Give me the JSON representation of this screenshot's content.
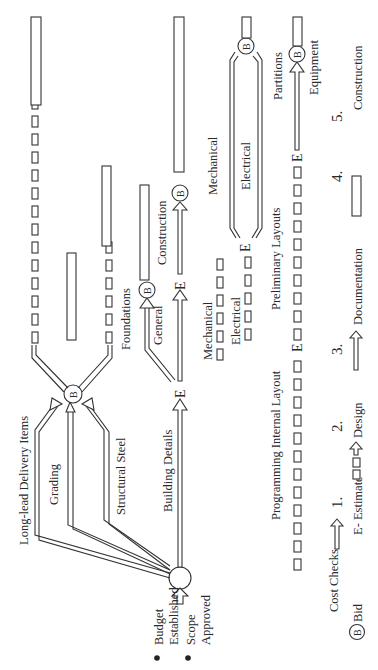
{
  "diagram": {
    "orientation": "rotated-90-ccw",
    "start": {
      "bullets": [
        "Budget Established",
        "Scope Approved"
      ],
      "budget_line1": "Budget",
      "budget_line2": "Established",
      "scope_line1": "Scope",
      "scope_line2": "Approved"
    },
    "paths": {
      "long_lead": "Long-lead Delivery Items",
      "grading": "Grading",
      "structural_steel": "Structural Steel",
      "building_details": "Building Details",
      "foundations": "Foundations",
      "general": "General",
      "construction": "Construction",
      "mechanical_1": "Mechanical",
      "mechanical_2": "Mechanical",
      "electrical_1": "Electrical",
      "electrical_2": "Electrical",
      "programming": "Programming Internal Layout",
      "preliminary": "Preliminary Layouts",
      "partitions": "Partitions",
      "equipment": "Equipment"
    },
    "nodes": {
      "bid_symbol": "B",
      "estimate_symbol": "E"
    },
    "legend": {
      "cost_checks": "Cost Checks",
      "bid": "Bid",
      "bid_symbol": "B",
      "estimate": "E- Estimate",
      "items": [
        {
          "num": "1.",
          "label": ""
        },
        {
          "num": "2.",
          "label": "Design"
        },
        {
          "num": "3.",
          "label": "Documentation"
        },
        {
          "num": "4.",
          "label": ""
        },
        {
          "num": "5.",
          "label": "Construction"
        }
      ]
    }
  }
}
